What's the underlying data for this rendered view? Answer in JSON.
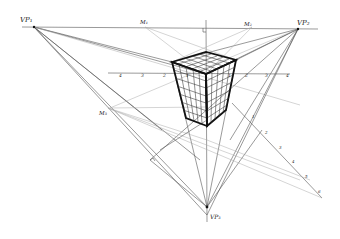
{
  "diagram": {
    "labels": {
      "vp1": "VP₁",
      "vp2": "VP₂",
      "vp3": "VP₃",
      "m1": "M₁",
      "m2": "M₂",
      "m3": "M₃"
    },
    "points": {
      "vp1": [
        34,
        27
      ],
      "vp2": [
        298,
        29
      ],
      "vp3": [
        207,
        207
      ],
      "m1": [
        145,
        27
      ],
      "m2": [
        252,
        27
      ],
      "m3": [
        108,
        108
      ]
    },
    "tick_labels_left": [
      "4",
      "3",
      "2",
      "1"
    ],
    "tick_labels_right": [
      "1",
      "2",
      "3",
      "4"
    ],
    "tick_labels_diagonal": [
      "1",
      "2",
      "3",
      "4",
      "5",
      "6"
    ],
    "colors": {
      "ink": "#111111",
      "construction": "#555555",
      "faint": "#aaaaaa",
      "background": "#ffffff"
    }
  }
}
